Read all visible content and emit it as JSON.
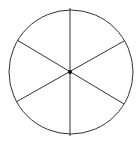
{
  "diagram": {
    "type": "circle-divided-into-sectors",
    "sectors": 6,
    "diameters": 3,
    "colors": {
      "stroke": "#333333",
      "background": "#ffffff",
      "center": "#111111"
    },
    "circle": {
      "cx": 71,
      "cy": 72,
      "r": 62
    },
    "lines": [
      {
        "x1": 70,
        "y1": 8,
        "x2": 70,
        "y2": 136
      },
      {
        "x1": 17,
        "y1": 40,
        "x2": 124,
        "y2": 104
      },
      {
        "x1": 16,
        "y1": 102,
        "x2": 124,
        "y2": 41
      }
    ]
  }
}
